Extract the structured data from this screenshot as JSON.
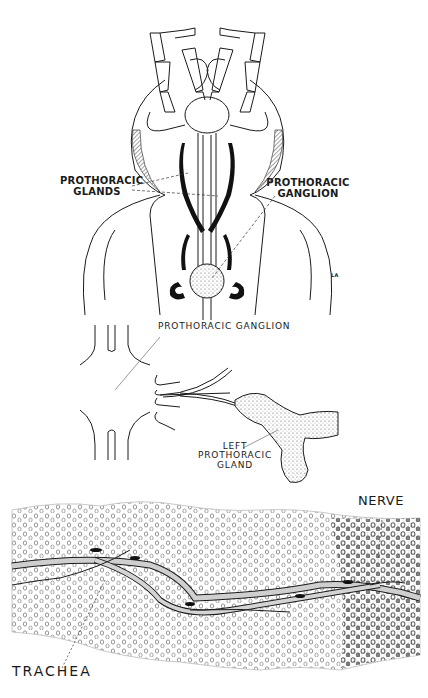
{
  "figure": {
    "panels": [
      {
        "id": "top",
        "description": "Dorsal view of insect head and prothorax showing prothoracic glands and ganglion",
        "labels": {
          "glands_line1": "PROTHORACIC",
          "glands_line2": "GLANDS",
          "ganglion_line1": "PROTHORACIC",
          "ganglion_line2": "GANGLION",
          "initials": "LA"
        }
      },
      {
        "id": "middle",
        "description": "Prothoracic ganglion with nerve leading to left prothoracic gland",
        "labels": {
          "ganglion": "PROTHORACIC GANGLION",
          "gland_line1": "LEFT",
          "gland_line2": "PROTHORACIC",
          "gland_line3": "GLAND"
        }
      },
      {
        "id": "bottom",
        "description": "Section of prothoracic gland tissue with trachea and nerve",
        "labels": {
          "nerve": "NERVE",
          "trachea": "TRACHEA"
        }
      }
    ],
    "colors": {
      "ink": "#1a1a1a",
      "stipple": "#bdbdbd",
      "background": "#ffffff"
    }
  }
}
